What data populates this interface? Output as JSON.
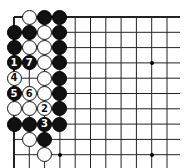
{
  "board": {
    "grid": {
      "origin_x": 14,
      "origin_y": 17,
      "spacing": 15.3,
      "cols": 11,
      "rows": 10,
      "right_edge_x": 180,
      "bottom_edge_y": 168
    },
    "colors": {
      "black": "#111111",
      "white": "#ffffff",
      "line": "#222222",
      "background": "#ffffff"
    },
    "star_points": [
      {
        "c": 9,
        "r": 3
      },
      {
        "c": 3,
        "r": 9
      },
      {
        "c": 9,
        "r": 9
      }
    ],
    "stones": [
      {
        "c": 1,
        "r": 0,
        "color": "white",
        "label": ""
      },
      {
        "c": 2,
        "r": 0,
        "color": "black",
        "label": ""
      },
      {
        "c": 3,
        "r": 0,
        "color": "black",
        "label": ""
      },
      {
        "c": 0,
        "r": 1,
        "color": "black",
        "label": ""
      },
      {
        "c": 1,
        "r": 1,
        "color": "black",
        "label": ""
      },
      {
        "c": 2,
        "r": 1,
        "color": "white",
        "label": ""
      },
      {
        "c": 3,
        "r": 1,
        "color": "black",
        "label": ""
      },
      {
        "c": 0,
        "r": 2,
        "color": "black",
        "label": ""
      },
      {
        "c": 1,
        "r": 2,
        "color": "white",
        "label": ""
      },
      {
        "c": 2,
        "r": 2,
        "color": "white",
        "label": ""
      },
      {
        "c": 3,
        "r": 2,
        "color": "black",
        "label": ""
      },
      {
        "c": 0,
        "r": 3,
        "color": "black",
        "label": "1"
      },
      {
        "c": 1,
        "r": 3,
        "color": "black",
        "label": "7"
      },
      {
        "c": 2,
        "r": 3,
        "color": "white",
        "label": ""
      },
      {
        "c": 3,
        "r": 3,
        "color": "black",
        "label": ""
      },
      {
        "c": 0,
        "r": 4,
        "color": "white",
        "label": "4"
      },
      {
        "c": 2,
        "r": 4,
        "color": "white",
        "label": ""
      },
      {
        "c": 3,
        "r": 4,
        "color": "black",
        "label": ""
      },
      {
        "c": 0,
        "r": 5,
        "color": "black",
        "label": "5"
      },
      {
        "c": 1,
        "r": 5,
        "color": "white",
        "label": "6"
      },
      {
        "c": 2,
        "r": 5,
        "color": "white",
        "label": ""
      },
      {
        "c": 3,
        "r": 5,
        "color": "black",
        "label": ""
      },
      {
        "c": 0,
        "r": 6,
        "color": "white",
        "label": ""
      },
      {
        "c": 1,
        "r": 6,
        "color": "white",
        "label": ""
      },
      {
        "c": 2,
        "r": 6,
        "color": "white",
        "label": "2"
      },
      {
        "c": 3,
        "r": 6,
        "color": "black",
        "label": ""
      },
      {
        "c": 0,
        "r": 7,
        "color": "black",
        "label": ""
      },
      {
        "c": 1,
        "r": 7,
        "color": "black",
        "label": ""
      },
      {
        "c": 2,
        "r": 7,
        "color": "black",
        "label": "3"
      },
      {
        "c": 3,
        "r": 7,
        "color": "black",
        "label": ""
      },
      {
        "c": 1,
        "r": 8,
        "color": "white",
        "label": ""
      },
      {
        "c": 2,
        "r": 8,
        "color": "black",
        "label": ""
      },
      {
        "c": 2,
        "r": 9,
        "color": "white",
        "label": ""
      }
    ]
  }
}
